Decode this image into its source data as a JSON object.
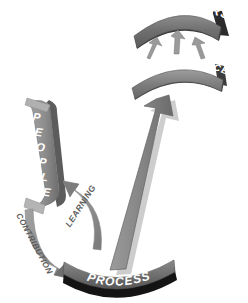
{
  "diagram": {
    "background_color": "#ffffff",
    "palette": {
      "band_mid_gray": "#6e6e6e",
      "band_light_gray": "#9a9a9a",
      "band_dark_edge": "#3f3f3f",
      "shadow_black": "#1b1b1b",
      "arrow_gray": "#8a8a8a",
      "arrow_dark_gray": "#6f6f6f",
      "label_text": "#5d5d5d",
      "band_text": "#ffffff"
    },
    "nodes": [
      {
        "id": "customers",
        "label": "CUSTOMERS",
        "shape": "curved-banner-arc-up",
        "position": "top"
      },
      {
        "id": "goods-services",
        "label": "GOODS / SERVICES",
        "shape": "curved-banner-arc-up",
        "position": "upper-middle"
      },
      {
        "id": "people",
        "label": "PEOPLE",
        "letters": [
          "P",
          "E",
          "O",
          "P",
          "L",
          "E"
        ],
        "shape": "curved-vertical-band",
        "position": "left"
      },
      {
        "id": "process",
        "label": "PROCESS",
        "shape": "curved-banner-arc-down",
        "position": "bottom"
      }
    ],
    "connectors": [
      {
        "id": "process-to-goods",
        "label": "",
        "type": "large-straight-arrow",
        "from": "process",
        "to": "goods-services",
        "direction": "up"
      },
      {
        "id": "goods-to-customers",
        "label": "",
        "type": "small-arrow-triple",
        "from": "goods-services",
        "to": "customers",
        "direction": "up",
        "count": 3
      },
      {
        "id": "learning",
        "label": "LEARNING",
        "type": "curved-arrow",
        "from": "process",
        "to": "people",
        "direction": "up-left"
      },
      {
        "id": "contribution",
        "label": "CONTRIBUTION",
        "type": "curved-arrow",
        "from": "people",
        "to": "process",
        "direction": "down-right"
      }
    ]
  }
}
